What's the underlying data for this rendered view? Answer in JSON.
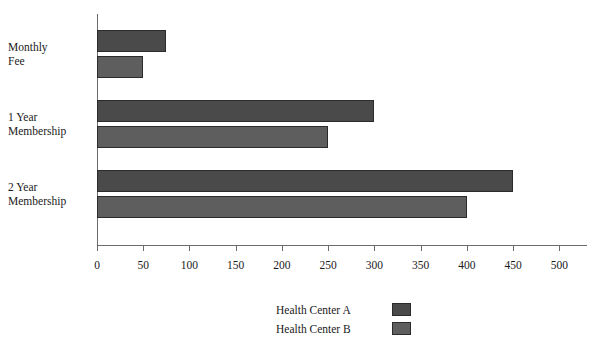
{
  "chart_data": {
    "type": "bar",
    "orientation": "horizontal",
    "title": "",
    "subtitle": "",
    "xlabel": "",
    "ylabel": "",
    "categories": [
      "Monthly Fee",
      "1 Year Membership",
      "2 Year Membership"
    ],
    "category_lines": [
      [
        "Monthly",
        "Fee"
      ],
      [
        "1 Year",
        "Membership"
      ],
      [
        "2 Year",
        "Membership"
      ]
    ],
    "series": [
      {
        "name": "Health Center A",
        "color": "#4a4a4a",
        "values": [
          75,
          300,
          450
        ]
      },
      {
        "name": "Health Center B",
        "color": "#5e5e5e",
        "values": [
          50,
          250,
          400
        ]
      }
    ],
    "xticks": [
      0,
      50,
      100,
      150,
      200,
      250,
      300,
      350,
      400,
      450,
      500
    ],
    "xtick_labels": [
      "0",
      "50",
      "100",
      "150",
      "200",
      "250",
      "300",
      "350",
      "400",
      "450",
      "500"
    ],
    "xlim": [
      0,
      530
    ],
    "grid": false,
    "legend_position": "bottom-center",
    "legend": [
      {
        "label": "Health Center A",
        "color": "#4a4a4a"
      },
      {
        "label": "Health Center B",
        "color": "#5e5e5e"
      }
    ]
  },
  "axes": {
    "axis_color": "#6b6b6b",
    "bar_border_color": "#2b2b2b"
  },
  "title_fragment": "."
}
